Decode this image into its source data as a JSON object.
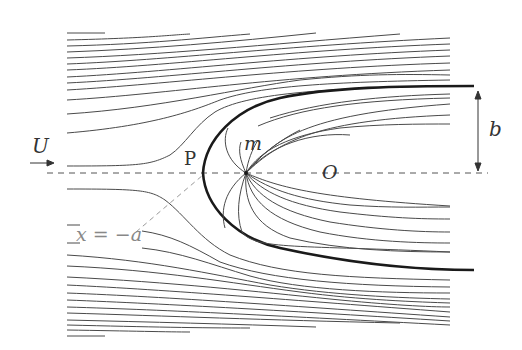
{
  "figure": {
    "labels": {
      "uniform_velocity": "U",
      "stagnation_point": "P",
      "source": "m",
      "origin": "O",
      "half_width": "b",
      "stagnation_location": "x = −a"
    },
    "colors": {
      "streamline": "#4a4a4a",
      "body_boundary": "#1a1a1a",
      "axis_dash": "#555555",
      "leader_dash": "#999999",
      "background": "#ffffff"
    },
    "geometry": {
      "axis_y": 173,
      "source_x": 246,
      "stagnation_x": 203,
      "boundary_top_y": 86,
      "boundary_bottom_y": 270,
      "streamline_start_x": 67,
      "streamline_end_x": 450,
      "boundary_end_x": 474
    }
  }
}
